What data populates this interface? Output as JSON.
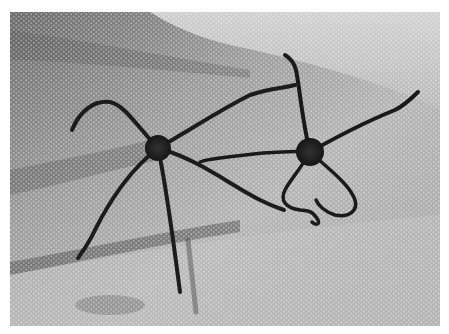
{
  "image": {
    "caption": "Two brittle stars on mesh netting",
    "style": "grayscale photograph",
    "subjects": [
      {
        "name": "brittle star (left)",
        "arms": 5,
        "center": [
          158,
          148
        ]
      },
      {
        "name": "brittle star (right)",
        "arms": 5,
        "center": [
          310,
          152
        ]
      }
    ],
    "background": "white mesh net with folds and shadows",
    "colors": {
      "border": "#ffffff",
      "mesh_light": "#d8d8d8",
      "mesh_dark": "#6e6e6e",
      "animal": "#1c1c1c"
    }
  }
}
